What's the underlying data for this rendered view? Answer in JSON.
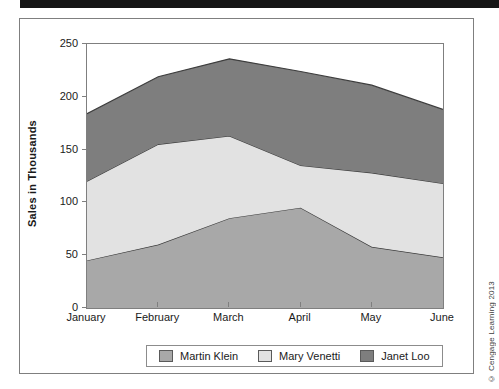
{
  "page": {
    "copyright": "© Cengage Learning 2013"
  },
  "chart_data": {
    "type": "area",
    "stacked": true,
    "title": "",
    "xlabel": "",
    "ylabel": "Sales in Thousands",
    "x": [
      "January",
      "February",
      "March",
      "April",
      "May",
      "June"
    ],
    "series": [
      {
        "name": "Martin Klein",
        "color": "#a8a8a8",
        "values": [
          45,
          60,
          85,
          95,
          58,
          48
        ]
      },
      {
        "name": "Mary Venetti",
        "color": "#e2e2e2",
        "values": [
          75,
          95,
          78,
          40,
          70,
          70
        ]
      },
      {
        "name": "Janet Loo",
        "color": "#7e7e7e",
        "values": [
          64,
          64,
          73,
          89,
          83,
          70
        ]
      }
    ],
    "stacked_tops": {
      "martin_klein": [
        45,
        60,
        85,
        95,
        58,
        48
      ],
      "mary_venetti": [
        120,
        155,
        163,
        135,
        128,
        118
      ],
      "janet_loo": [
        184,
        219,
        236,
        224,
        211,
        188
      ]
    },
    "ylim": [
      0,
      250
    ],
    "yticks": [
      0,
      50,
      100,
      150,
      200,
      250
    ],
    "grid": false,
    "legend_position": "bottom",
    "outline_color": "#3d3d3d",
    "axis_color": "#7f7f7f"
  }
}
